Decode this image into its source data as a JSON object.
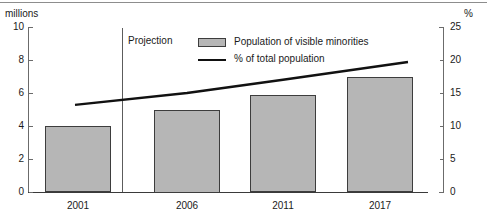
{
  "chart_data": {
    "type": "bar",
    "title": "",
    "subtitle": "",
    "categories": [
      "2001",
      "2006",
      "2011",
      "2017"
    ],
    "left_axis": {
      "label": "millions",
      "ticks": [
        "0",
        "2",
        "4",
        "6",
        "8",
        "10"
      ],
      "tick_values": [
        0,
        2,
        4,
        6,
        8,
        10
      ],
      "ylim": [
        0,
        10
      ]
    },
    "right_axis": {
      "label": "%",
      "ticks": [
        "0",
        "5",
        "10",
        "15",
        "20",
        "25"
      ],
      "tick_values": [
        0,
        5,
        10,
        15,
        20,
        25
      ],
      "ylim": [
        0,
        25
      ]
    },
    "xlabel": "",
    "ylabel": "millions",
    "grid": false,
    "legend_position": "top-center",
    "series": [
      {
        "name": "Population of visible minorities",
        "type": "bar",
        "axis": "left",
        "values": [
          4.0,
          5.0,
          5.9,
          7.0
        ],
        "fill_color": "#b6b6b6",
        "border_color": "#3d3d3d"
      },
      {
        "name": "% of total population",
        "type": "line",
        "axis": "right",
        "values": [
          13.2,
          15.0,
          17.0,
          19.7
        ],
        "color": "#111111"
      }
    ],
    "annotations": [
      {
        "text": "Projection",
        "x_category": "between-2001-and-2006",
        "type": "divider-label"
      }
    ]
  },
  "legend": {
    "items": [
      {
        "label": "Population of visible minorities",
        "marker": "bar-swatch"
      },
      {
        "label": "% of total population",
        "marker": "line-swatch"
      }
    ]
  },
  "annotation": {
    "projection_label": "Projection"
  }
}
